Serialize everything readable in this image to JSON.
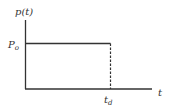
{
  "diagram": {
    "type": "rectangular-pulse",
    "y_axis_label": "p(t)",
    "x_axis_label": "t",
    "amplitude_label_main": "P",
    "amplitude_label_sub": "o",
    "duration_label_main": "t",
    "duration_label_sub": "d",
    "line_color": "#333333",
    "background_color": "#ffffff"
  }
}
